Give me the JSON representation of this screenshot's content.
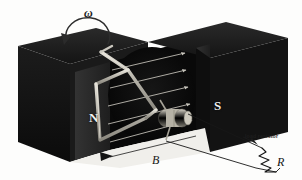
{
  "figure": {
    "background_color": "#fdfdfc"
  },
  "labels": {
    "angular_velocity": "ω",
    "north_pole": "N",
    "south_pole": "S",
    "magnetic_field": "B",
    "resistor_symbol": "R",
    "load_resistor_callout": "load resistor"
  },
  "icons": {
    "rotation_arrow": "curved-arrow-counterclockwise",
    "field_arrows": "arrow-right",
    "resistor": "zigzag-resistor",
    "callout_arrow": "leader-line-arrow"
  },
  "colors": {
    "magnet_body": "#151515",
    "magnet_top_face": "#232323",
    "magnet_pole_face": "#2c2c2c",
    "field_disc": "#0d0d0d",
    "wire_loop": "#b9b6ae",
    "slip_ring": "#b4b0a4",
    "label_light": "#f2f2f0",
    "label_dark": "#171717",
    "lead_wire": "#1a1a1a"
  },
  "field": {
    "arrow_count": 5,
    "direction": "left-to-right (N to S)"
  },
  "geometry": {
    "width": 302,
    "height": 180,
    "left_magnet_pole": "N",
    "right_magnet_pole": "S"
  }
}
